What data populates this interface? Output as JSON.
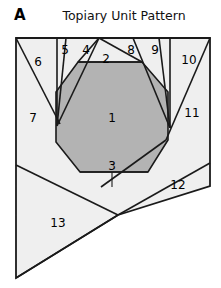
{
  "figure": {
    "panel_letter": "A",
    "title": "Topiary Unit Pattern",
    "colors": {
      "background": "#ffffff",
      "tile_fill": "#efefef",
      "center_fill": "#b3b3b3",
      "stroke": "#1a1a1a",
      "text": "#000000"
    }
  },
  "outline": {
    "name": "topiary-unit-outline",
    "points": "16,38 210,38 210,186 118,215 16,278"
  },
  "center_polygon": {
    "name": "inscribed-circle-region",
    "points": "78,62 142,62 168,92 168,140 148,172 80,172 56,142 56,92"
  },
  "edges": [
    {
      "name": "edge-6-7-divider",
      "d": "M 16,38 L 60,124"
    },
    {
      "name": "edge-6-5-divider",
      "d": "M 57,38 L 57,126"
    },
    {
      "name": "edge-5-4-divider",
      "d": "M 66,38 L 57,126"
    },
    {
      "name": "edge-4-2-divider",
      "d": "M 99,38 L 57,126"
    },
    {
      "name": "edge-2-top-chord",
      "d": "M 78,62 L 142,62"
    },
    {
      "name": "edge-4-2-upper",
      "d": "M 99,38 L 142,62"
    },
    {
      "name": "edge-2-8-divider",
      "d": "M 99,38 L 78,62"
    },
    {
      "name": "edge-8-9-divider",
      "d": "M 133,38 L 170,128"
    },
    {
      "name": "edge-9-10-divider",
      "d": "M 159,38 L 170,128"
    },
    {
      "name": "edge-10-right",
      "d": "M 170,38 L 170,128"
    },
    {
      "name": "edge-10-11-divider",
      "d": "M 210,38 L 166,140"
    },
    {
      "name": "edge-7-13-divider",
      "d": "M 16,165 L 118,215"
    },
    {
      "name": "edge-12-upper",
      "d": "M 210,163 L 118,215"
    },
    {
      "name": "edge-3-chord",
      "d": "M 80,172 L 148,172"
    },
    {
      "name": "edge-3-tick",
      "d": "M 112,172 L 112,187"
    },
    {
      "name": "edge-11-12-divider",
      "d": "M 166,140 L 101,187"
    },
    {
      "name": "edge-bottom-left-fold",
      "d": "M 16,278 L 118,215"
    }
  ],
  "labels": [
    {
      "id": "1",
      "x": 112,
      "y": 118
    },
    {
      "id": "2",
      "x": 106,
      "y": 59
    },
    {
      "id": "3",
      "x": 112,
      "y": 166
    },
    {
      "id": "4",
      "x": 86,
      "y": 50
    },
    {
      "id": "5",
      "x": 65,
      "y": 50
    },
    {
      "id": "6",
      "x": 38,
      "y": 62
    },
    {
      "id": "7",
      "x": 33,
      "y": 118
    },
    {
      "id": "8",
      "x": 131,
      "y": 50
    },
    {
      "id": "9",
      "x": 155,
      "y": 50
    },
    {
      "id": "10",
      "x": 189,
      "y": 60
    },
    {
      "id": "11",
      "x": 192,
      "y": 113
    },
    {
      "id": "12",
      "x": 178,
      "y": 185
    },
    {
      "id": "13",
      "x": 58,
      "y": 223
    }
  ]
}
